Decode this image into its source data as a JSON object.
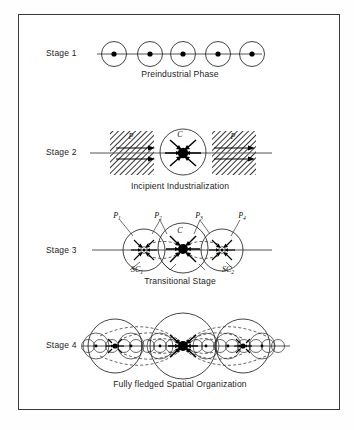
{
  "figure": {
    "border_color": "#3a3a3a",
    "background": "#ffffff"
  },
  "stages": [
    {
      "id": "stage-1",
      "label": "Stage 1",
      "caption": "Preindustrial Phase",
      "node_count": 5,
      "node_kind": "circle-with-center-dot",
      "has_hatching": false,
      "has_arrows": false,
      "has_dashed_links": false
    },
    {
      "id": "stage-2",
      "label": "Stage 2",
      "caption": "Incipient Industrialization",
      "center_label": "C",
      "periphery_labels": [
        "P",
        "P"
      ],
      "node_count": 1,
      "node_kind": "large-circle-with-core-dot",
      "has_hatching": true,
      "has_arrows": true,
      "has_dashed_links": false
    },
    {
      "id": "stage-3",
      "label": "Stage 3",
      "caption": "Transitional Stage",
      "center_label": "C",
      "periphery_labels": [
        "P1",
        "P2",
        "P3",
        "P4"
      ],
      "subcenter_labels": [
        "SC1",
        "SC2"
      ],
      "node_count": 3,
      "node_kind": "overlapping-circles",
      "has_hatching": false,
      "has_arrows": true,
      "has_dashed_links": true
    },
    {
      "id": "stage-4",
      "label": "Stage 4",
      "caption": "Fully fledged Spatial Organization",
      "node_count": 17,
      "node_kind": "nested-hierarchy",
      "has_hatching": false,
      "has_arrows": true,
      "has_dashed_links": true
    }
  ],
  "symbols": {
    "center": "C",
    "periphery": "P",
    "subcenter": "SC",
    "periphery_1": "P",
    "periphery_1_sub": "1",
    "periphery_2_sub": "2",
    "periphery_3_sub": "3",
    "periphery_4_sub": "4",
    "subcenter_1_sub": "1",
    "subcenter_2_sub": "2"
  }
}
